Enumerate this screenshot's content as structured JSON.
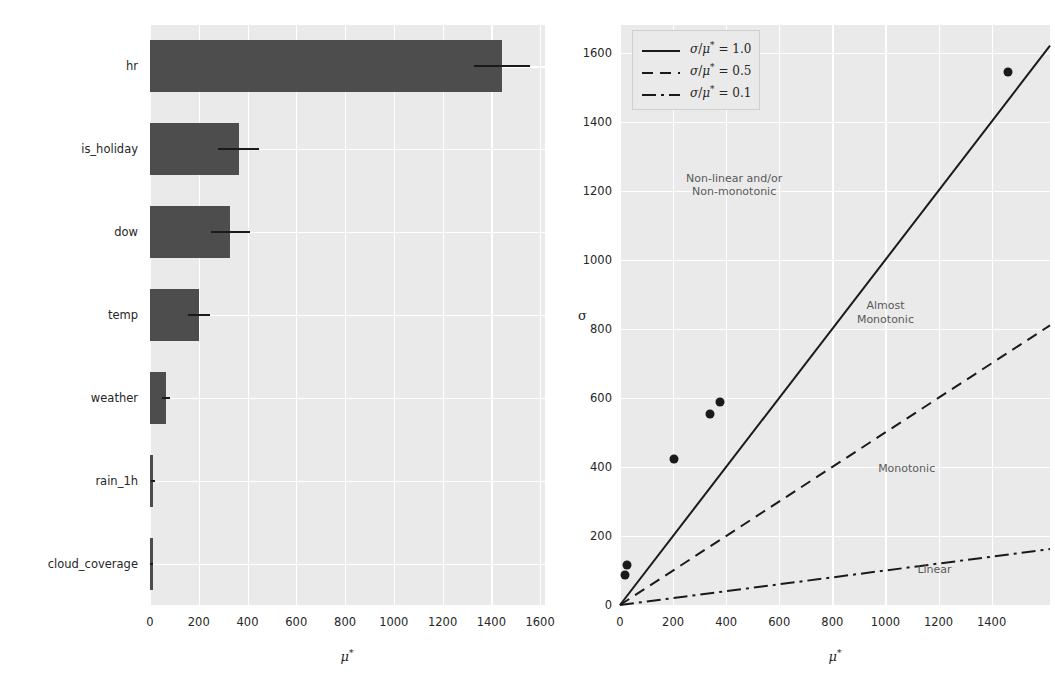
{
  "figure": {
    "width": 1055,
    "height": 698,
    "background": "#ffffff",
    "panel_background": "#eaeaea",
    "grid_color": "#ffffff",
    "bar_color": "#4d4d4d",
    "marker_color": "#1a1a1a",
    "text_color": "#262626"
  },
  "chart_data": [
    {
      "type": "bar",
      "orientation": "horizontal",
      "title": "",
      "xlabel": "μ*",
      "ylabel": "",
      "xlim": [
        0,
        1620
      ],
      "xticks": [
        0,
        200,
        400,
        600,
        800,
        1000,
        1200,
        1400,
        1600
      ],
      "xticklabels": [
        "0",
        "200",
        "400",
        "600",
        "800",
        "1000",
        "1200",
        "1400",
        "1600"
      ],
      "grid": true,
      "categories": [
        "hr",
        "is_holiday",
        "dow",
        "temp",
        "weather",
        "rain_1h",
        "cloud_coverage"
      ],
      "values": [
        1445,
        363,
        330,
        200,
        66,
        12,
        2
      ],
      "errors": [
        115,
        85,
        80,
        45,
        18,
        8,
        5
      ]
    },
    {
      "type": "scatter",
      "title": "",
      "xlabel": "μ*",
      "ylabel": "σ",
      "xlim": [
        0,
        1620
      ],
      "ylim": [
        0,
        1680
      ],
      "xticks": [
        0,
        200,
        400,
        600,
        800,
        1000,
        1200,
        1400
      ],
      "xticklabels": [
        "0",
        "200",
        "400",
        "600",
        "800",
        "1000",
        "1200",
        "1400"
      ],
      "yticks": [
        0,
        200,
        400,
        600,
        800,
        1000,
        1200,
        1400,
        1600
      ],
      "yticklabels": [
        "0",
        "200",
        "400",
        "600",
        "800",
        "1000",
        "1200",
        "1400",
        "1600"
      ],
      "grid": true,
      "points": [
        {
          "x": 1460,
          "y": 1545
        },
        {
          "x": 375,
          "y": 588
        },
        {
          "x": 338,
          "y": 552
        },
        {
          "x": 203,
          "y": 424
        },
        {
          "x": 28,
          "y": 115
        },
        {
          "x": 18,
          "y": 88
        }
      ],
      "reference_lines": [
        {
          "label": "σ/μ* = 1.0",
          "slope": 1.0,
          "style": "solid"
        },
        {
          "label": "σ/μ* = 0.5",
          "slope": 0.5,
          "style": "dashed"
        },
        {
          "label": "σ/μ* = 0.1",
          "slope": 0.1,
          "style": "dashdot"
        }
      ],
      "annotations": [
        {
          "text": "Non-linear and/or\nNon-monotonic",
          "x": 430,
          "y": 1215
        },
        {
          "text": "Almost\nMonotonic",
          "x": 1000,
          "y": 845
        },
        {
          "text": "Monotonic",
          "x": 1080,
          "y": 395
        },
        {
          "text": "Linear",
          "x": 1185,
          "y": 100
        }
      ],
      "legend_position": "upper left"
    }
  ],
  "left_chart": {
    "xlabel_mu": "μ",
    "xlabel_star": "*",
    "categories": [
      {
        "label": "hr"
      },
      {
        "label": "is_holiday"
      },
      {
        "label": "dow"
      },
      {
        "label": "temp"
      },
      {
        "label": "weather"
      },
      {
        "label": "rain_1h"
      },
      {
        "label": "cloud_coverage"
      }
    ],
    "xticklabels": [
      "0",
      "200",
      "400",
      "600",
      "800",
      "1000",
      "1200",
      "1400",
      "1600"
    ]
  },
  "right_chart": {
    "xlabel_mu": "μ",
    "xlabel_star": "*",
    "ylabel": "σ",
    "xticklabels": [
      "0",
      "200",
      "400",
      "600",
      "800",
      "1000",
      "1200",
      "1400"
    ],
    "yticklabels": [
      "0",
      "200",
      "400",
      "600",
      "800",
      "1000",
      "1200",
      "1400",
      "1600"
    ],
    "legend": [
      {
        "sigma": "σ",
        "slash": "/",
        "mu": "μ",
        "star": "*",
        "eq": " = 1.0",
        "style": "solid"
      },
      {
        "sigma": "σ",
        "slash": "/",
        "mu": "μ",
        "star": "*",
        "eq": " = 0.5",
        "style": "dashed"
      },
      {
        "sigma": "σ",
        "slash": "/",
        "mu": "μ",
        "star": "*",
        "eq": " = 0.1",
        "style": "dashdot"
      }
    ],
    "annotations": {
      "nonlinear_l1": "Non-linear and/or",
      "nonlinear_l2": "Non-monotonic",
      "almost_l1": "Almost",
      "almost_l2": "Monotonic",
      "monotonic": "Monotonic",
      "linear": "Linear"
    }
  }
}
